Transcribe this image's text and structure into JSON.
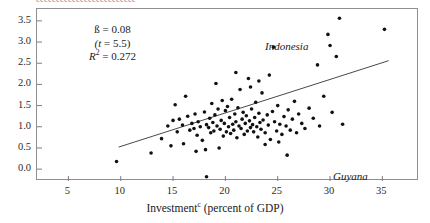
{
  "figure": {
    "page_bleed_text": "eeeeeeeeeeeeeeeeeeeeeeeee",
    "xaxis_title": "Investment",
    "xaxis_title_footnote": "c",
    "xaxis_title_suffix": " (percent of GDP)"
  },
  "stats": {
    "beta_label": "ß = 0.08",
    "t_label": "(t = 5.5)",
    "r2_symbol": "R",
    "r2_sup": "2",
    "r2_value": " = 0.272"
  },
  "annotations": [
    {
      "name": "indonesia",
      "text": "Indonesia"
    },
    {
      "name": "guyana",
      "text": "Guyana"
    }
  ],
  "chart_data": {
    "type": "scatter",
    "title": "",
    "xlabel": "Investmentᶜ (percent of GDP)",
    "ylabel": "",
    "xlim": [
      2.0,
      38.5
    ],
    "ylim": [
      -0.28,
      3.78
    ],
    "xticks": [
      5,
      10,
      15,
      20,
      25,
      30,
      35
    ],
    "yticks": [
      0.0,
      0.5,
      1.0,
      1.5,
      2.0,
      2.5,
      3.0,
      3.5
    ],
    "ytick_labels": [
      "0.0",
      "0.5",
      "1.0",
      "1.5",
      "2.0",
      "2.5",
      "3.0",
      "3.5"
    ],
    "xtick_labels": [
      "5",
      "10",
      "15",
      "20",
      "25",
      "30",
      "35"
    ],
    "grid": false,
    "legend": false,
    "marker": {
      "shape": "dot",
      "size_px": 1.8,
      "color": "#111111"
    },
    "fit_line": {
      "type": "linear",
      "slope": 0.08,
      "t_stat": 5.5,
      "r_squared": 0.272,
      "color": "#333333",
      "x_start": 9.8,
      "y_start": 0.52,
      "x_end": 35.6,
      "y_end": 2.56
    },
    "annotations": [
      {
        "text": "Indonesia",
        "x": 24.6,
        "y": 3.05,
        "point_x": 24.6,
        "point_y": 2.88,
        "italic": true
      },
      {
        "text": "Guyana",
        "x": 26.9,
        "y": 0.22,
        "point_x": 25.9,
        "point_y": 0.33,
        "italic": true
      }
    ],
    "points": [
      [
        9.6,
        0.18
      ],
      [
        13.9,
        0.72
      ],
      [
        14.5,
        1.02
      ],
      [
        14.8,
        0.55
      ],
      [
        15.0,
        1.15
      ],
      [
        15.2,
        1.52
      ],
      [
        15.4,
        0.88
      ],
      [
        15.6,
        1.18
      ],
      [
        15.9,
        1.04
      ],
      [
        16.0,
        0.6
      ],
      [
        16.2,
        1.72
      ],
      [
        16.4,
        1.25
      ],
      [
        16.6,
        0.92
      ],
      [
        16.8,
        1.08
      ],
      [
        17.0,
        0.96
      ],
      [
        17.1,
        1.3
      ],
      [
        17.3,
        0.8
      ],
      [
        17.4,
        1.12
      ],
      [
        17.6,
        1.0
      ],
      [
        17.8,
        0.68
      ],
      [
        18.0,
        1.35
      ],
      [
        18.1,
        0.46
      ],
      [
        18.2,
        1.05
      ],
      [
        18.4,
        0.98
      ],
      [
        18.5,
        1.2
      ],
      [
        18.6,
        0.86
      ],
      [
        18.7,
        1.55
      ],
      [
        18.8,
        1.1
      ],
      [
        18.9,
        0.9
      ],
      [
        19.0,
        1.28
      ],
      [
        19.1,
        2.02
      ],
      [
        19.2,
        1.02
      ],
      [
        19.3,
        1.42
      ],
      [
        19.5,
        0.94
      ],
      [
        19.6,
        1.15
      ],
      [
        19.7,
        1.62
      ],
      [
        19.8,
        0.78
      ],
      [
        19.9,
        1.08
      ],
      [
        20.0,
        1.38
      ],
      [
        20.1,
        0.88
      ],
      [
        20.2,
        1.48
      ],
      [
        20.3,
        1.0
      ],
      [
        20.4,
        1.22
      ],
      [
        20.5,
        0.84
      ],
      [
        20.6,
        1.65
      ],
      [
        20.7,
        1.06
      ],
      [
        20.8,
        0.92
      ],
      [
        20.9,
        1.3
      ],
      [
        21.0,
        1.12
      ],
      [
        21.1,
        0.74
      ],
      [
        21.2,
        1.45
      ],
      [
        21.3,
        1.02
      ],
      [
        21.4,
        1.88
      ],
      [
        21.5,
        0.96
      ],
      [
        21.6,
        1.18
      ],
      [
        21.7,
        1.34
      ],
      [
        21.8,
        0.82
      ],
      [
        21.9,
        1.08
      ],
      [
        22.0,
        1.26
      ],
      [
        22.1,
        0.9
      ],
      [
        22.2,
        2.14
      ],
      [
        22.3,
        1.14
      ],
      [
        22.4,
        0.98
      ],
      [
        22.5,
        1.42
      ],
      [
        22.6,
        1.05
      ],
      [
        22.7,
        0.88
      ],
      [
        22.8,
        1.22
      ],
      [
        22.9,
        1.58
      ],
      [
        23.0,
        1.0
      ],
      [
        23.1,
        0.76
      ],
      [
        23.2,
        1.32
      ],
      [
        23.3,
        1.1
      ],
      [
        23.4,
        0.94
      ],
      [
        23.5,
        1.8
      ],
      [
        23.6,
        1.16
      ],
      [
        23.8,
        0.86
      ],
      [
        24.0,
        1.28
      ],
      [
        24.1,
        1.04
      ],
      [
        24.2,
        2.22
      ],
      [
        24.3,
        0.7
      ],
      [
        24.5,
        1.36
      ],
      [
        24.7,
        1.12
      ],
      [
        24.9,
        0.9
      ],
      [
        25.0,
        1.5
      ],
      [
        25.2,
        1.06
      ],
      [
        25.4,
        0.82
      ],
      [
        25.6,
        1.24
      ],
      [
        25.8,
        1.02
      ],
      [
        26.0,
        1.4
      ],
      [
        26.2,
        0.92
      ],
      [
        26.4,
        1.18
      ],
      [
        26.6,
        1.6
      ],
      [
        26.8,
        0.86
      ],
      [
        27.0,
        1.3
      ],
      [
        27.3,
        1.08
      ],
      [
        27.6,
        0.96
      ],
      [
        28.0,
        1.44
      ],
      [
        28.4,
        1.2
      ],
      [
        28.8,
        2.46
      ],
      [
        29.0,
        1.02
      ],
      [
        29.4,
        1.72
      ],
      [
        29.8,
        3.18
      ],
      [
        30.0,
        2.92
      ],
      [
        30.2,
        1.34
      ],
      [
        30.6,
        2.66
      ],
      [
        30.9,
        3.56
      ],
      [
        31.2,
        1.06
      ],
      [
        18.2,
        -0.18
      ],
      [
        21.0,
        2.28
      ],
      [
        22.4,
        1.94
      ],
      [
        23.2,
        2.08
      ],
      [
        12.9,
        0.38
      ],
      [
        17.2,
        0.42
      ],
      [
        19.4,
        0.5
      ],
      [
        23.8,
        0.58
      ],
      [
        25.1,
        0.64
      ],
      [
        35.2,
        3.3
      ]
    ]
  }
}
